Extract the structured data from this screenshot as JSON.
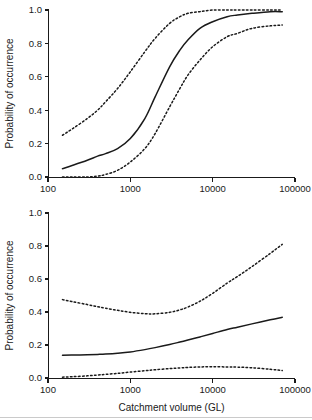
{
  "figure": {
    "width": 312,
    "height": 420,
    "background": "#ffffff",
    "ink_color": "#1a1a1a"
  },
  "chart_data": [
    {
      "type": "line",
      "panel": "top",
      "title": "",
      "xlabel": "",
      "ylabel": "Probability of occurrence",
      "xscale": "log",
      "xlim": [
        100,
        100000
      ],
      "ylim": [
        0.0,
        1.0
      ],
      "grid": false,
      "legend": "none",
      "xticks": [
        100,
        1000,
        10000,
        100000
      ],
      "xtick_labels": [
        "100",
        "1000",
        "10000",
        "100000"
      ],
      "yticks": [
        0.0,
        0.2,
        0.4,
        0.6,
        0.8,
        1.0
      ],
      "ytick_labels": [
        "0.0",
        "0.2",
        "0.4",
        "0.6",
        "0.8",
        "1.0"
      ],
      "x": [
        150,
        200,
        300,
        400,
        500,
        700,
        1000,
        1500,
        2000,
        3000,
        4000,
        5000,
        7000,
        10000,
        15000,
        20000,
        30000,
        50000,
        70000
      ],
      "series": [
        {
          "name": "upper confidence bound",
          "style": "dashed",
          "values": [
            0.25,
            0.29,
            0.35,
            0.4,
            0.45,
            0.53,
            0.63,
            0.75,
            0.83,
            0.92,
            0.96,
            0.98,
            0.99,
            1.0,
            1.0,
            1.0,
            1.0,
            1.0,
            1.0
          ]
        },
        {
          "name": "mean fitted probability",
          "style": "solid",
          "values": [
            0.05,
            0.07,
            0.1,
            0.125,
            0.14,
            0.17,
            0.23,
            0.35,
            0.48,
            0.66,
            0.76,
            0.82,
            0.89,
            0.93,
            0.96,
            0.97,
            0.98,
            0.99,
            0.99
          ]
        },
        {
          "name": "lower confidence bound",
          "style": "dashed",
          "values": [
            0.0,
            0.0,
            0.0,
            0.005,
            0.015,
            0.04,
            0.09,
            0.17,
            0.26,
            0.42,
            0.53,
            0.61,
            0.7,
            0.78,
            0.84,
            0.86,
            0.89,
            0.905,
            0.91
          ]
        }
      ]
    },
    {
      "type": "line",
      "panel": "bottom",
      "title": "",
      "xlabel": "Catchment volume (GL)",
      "ylabel": "Probability of occurrence",
      "xscale": "log",
      "xlim": [
        100,
        100000
      ],
      "ylim": [
        0.0,
        1.0
      ],
      "grid": false,
      "legend": "none",
      "xticks": [
        100,
        1000,
        10000,
        100000
      ],
      "xtick_labels": [
        "100",
        "1000",
        "10000",
        "100000"
      ],
      "yticks": [
        0.0,
        0.2,
        0.4,
        0.6,
        0.8,
        1.0
      ],
      "ytick_labels": [
        "0.0",
        "0.2",
        "0.4",
        "0.6",
        "0.8",
        "1.0"
      ],
      "x": [
        150,
        200,
        300,
        400,
        500,
        700,
        1000,
        1500,
        2000,
        3000,
        4000,
        5000,
        7000,
        10000,
        15000,
        20000,
        30000,
        50000,
        70000
      ],
      "series": [
        {
          "name": "upper confidence bound",
          "style": "dashed",
          "values": [
            0.475,
            0.462,
            0.445,
            0.432,
            0.423,
            0.41,
            0.398,
            0.39,
            0.389,
            0.398,
            0.413,
            0.43,
            0.465,
            0.513,
            0.575,
            0.615,
            0.675,
            0.755,
            0.81
          ]
        },
        {
          "name": "mean fitted probability",
          "style": "solid",
          "values": [
            0.138,
            0.139,
            0.141,
            0.143,
            0.145,
            0.15,
            0.158,
            0.172,
            0.184,
            0.203,
            0.218,
            0.23,
            0.249,
            0.27,
            0.294,
            0.308,
            0.328,
            0.353,
            0.368
          ]
        },
        {
          "name": "lower confidence bound",
          "style": "dashed",
          "values": [
            0.005,
            0.008,
            0.013,
            0.018,
            0.022,
            0.028,
            0.036,
            0.044,
            0.05,
            0.057,
            0.061,
            0.064,
            0.067,
            0.068,
            0.067,
            0.066,
            0.062,
            0.053,
            0.045
          ]
        }
      ]
    }
  ]
}
